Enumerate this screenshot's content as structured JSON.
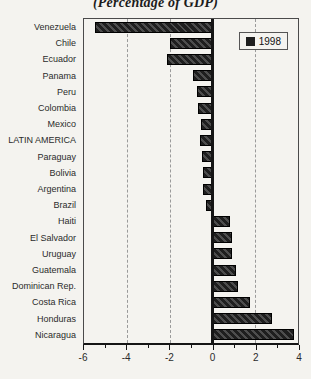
{
  "header": {
    "title": "(Percentage of GDP)"
  },
  "legend": {
    "label": "1998"
  },
  "colors": {
    "background": "#f4f3ef",
    "bar_dark": "#1e1e1e",
    "bar_hatch": "#4d4d4d",
    "axis": "#151515",
    "grid": "#9a9a9a",
    "text": "#2b2b2b",
    "legend_swatch": "#1e1e1e"
  },
  "chart_data": {
    "type": "bar",
    "orientation": "horizontal",
    "title": "(Percentage of GDP)",
    "legend_entries": [
      "1998"
    ],
    "legend_position": "top-right inside plot",
    "xlim": [
      -6,
      4
    ],
    "x_major_ticks": [
      -6,
      -4,
      -2,
      0,
      2,
      4
    ],
    "x_minor_ticks": [
      -5,
      -3,
      -1,
      1,
      3
    ],
    "gridlines_at_x": [
      -4,
      -2,
      2
    ],
    "grid_style": "dashed",
    "categories": [
      "Venezuela",
      "Chile",
      "Ecuador",
      "Panama",
      "Peru",
      "Colombia",
      "Mexico",
      "LATIN AMERICA",
      "Paraguay",
      "Bolivia",
      "Argentina",
      "Brazil",
      "Haiti",
      "El Salvador",
      "Uruguay",
      "Guatemala",
      "Dominican Rep.",
      "Costa Rica",
      "Honduras",
      "Nicaragua"
    ],
    "series": [
      {
        "name": "1998",
        "values": [
          -5.5,
          -2.0,
          -2.1,
          -0.9,
          -0.7,
          -0.65,
          -0.55,
          -0.6,
          -0.5,
          -0.45,
          -0.45,
          -0.3,
          0.8,
          0.9,
          0.9,
          1.1,
          1.2,
          1.75,
          2.8,
          3.8
        ]
      }
    ]
  }
}
